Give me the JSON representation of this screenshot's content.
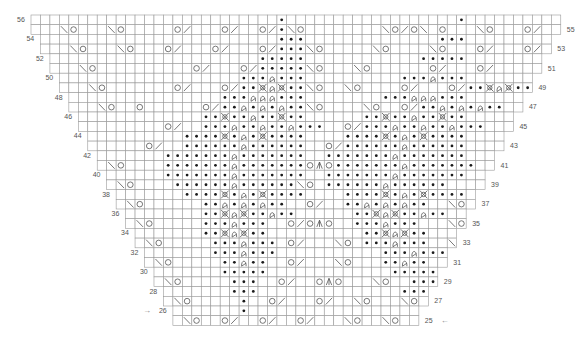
{
  "chart": {
    "origin_x": 31,
    "origin_y": 15,
    "cell_w": 9.46,
    "cell_h": 9.7,
    "cols": 56,
    "grid_color": "#9a9a9a",
    "symbol_color": "#555555",
    "purl_color": "#1a1a1a",
    "legend": {
      ".": "knit (empty)",
      "p": "purl (dot)",
      "o": "yarn over",
      "/": "k2tog",
      "\\": "ssk",
      "t": "twisted stitch",
      "x": "cross stitch",
      "a": "centered double decrease"
    },
    "rows": [
      {
        "n": 56,
        "s": 0,
        "e": 56,
        "d": "..........................p..................p.........."
      },
      {
        "n": 55,
        "s": 0,
        "e": 56,
        "d": "...\\o...\\o.....o/...o/..o/p\\o........\\o/o\\ o...\\o...o/...o/..."
      },
      {
        "n": 54,
        "s": 1,
        "e": 55,
        "d": "..........................ppp..............ppp........."
      },
      {
        "n": 53,
        "s": 1,
        "e": 55,
        "d": "....\\o...\\o...o/...o/...o/ppp\\o.....\\o....\\o...o/...o/..."
      },
      {
        "n": 52,
        "s": 2,
        "e": 54,
        "d": "........................ppppp............ppppp........"
      },
      {
        "n": 51,
        "s": 2,
        "e": 54,
        "d": ".....\\o..........o/...o/ppppp\\o...\\o......o/...o/......"
      },
      {
        "n": 50,
        "s": 3,
        "e": 53,
        "d": "......................ppptppp..........ppptppp........"
      },
      {
        "n": 49,
        "s": 3,
        "e": 53,
        "d": "......\\o.......o/...o/ppxtxpp\\o..\\o....o/...o/ppxtxpp."
      },
      {
        "n": 48,
        "s": 4,
        "e": 52,
        "d": "....................ppptttppp........ppptttppp........"
      },
      {
        "n": 47,
        "s": 4,
        "e": 52,
        "d": ".......\\o..o......o/pptptptpp\\o....\\o..o/pptptptpp....."
      },
      {
        "n": 46,
        "s": 5,
        "e": 51,
        "d": "..................ppxpptppxpp......ppxpptppxpp........."
      },
      {
        "n": 45,
        "s": 5,
        "e": 51,
        "d": "..............o/..ppptpptpptppp..o/ppptpptpptppp......."
      },
      {
        "n": 44,
        "s": 6,
        "e": 50,
        "d": "................ppppxptpxpppp....ppppxptpxpppp........."
      },
      {
        "n": 43,
        "s": 6,
        "e": 50,
        "d": "............o/..pppppptpppppp..o/pppppptpppppp........."
      },
      {
        "n": 42,
        "s": 7,
        "e": 49,
        "d": "..............ppppppptppppppp..ppppppptppppppp.........."
      },
      {
        "n": 41,
        "s": 7,
        "e": 49,
        "d": "........\\o....ppppppptpppppppoaoppppppptppppppp........."
      },
      {
        "n": 40,
        "s": 8,
        "e": 48,
        "d": "..............ppppppptppppppp..ppppppptppppppp........."
      },
      {
        "n": 39,
        "s": 8,
        "e": 48,
        "d": ".........\\o....pppppptpppppp\\o.pppppptpppppp..........."
      },
      {
        "n": 38,
        "s": 9,
        "e": 47,
        "d": "................ppppxptpxpppp....ppppxptpxpppp........."
      },
      {
        "n": 37,
        "s": 9,
        "e": 47,
        "d": "..........\\o......pptptptpp..o/..pptptptpp..\\o........"
      },
      {
        "n": 36,
        "s": 10,
        "e": 46,
        "d": "..................ppxtxpptpp......ppxtxpptpp..........."
      },
      {
        "n": 35,
        "s": 10,
        "e": 46,
        "d": "...........\\o.....ppptppp..o/oao..ppptppp...\\o........"
      },
      {
        "n": 34,
        "s": 11,
        "e": 45,
        "d": "..................ppxtxpp..........ppxtxpp............."
      },
      {
        "n": 33,
        "s": 11,
        "e": 45,
        "d": "............\\o.....ppptppp.o/...\\o.ppptppp..\\o........"
      },
      {
        "n": 32,
        "s": 12,
        "e": 44,
        "d": "...................ppptppp...........ppptppp..........."
      },
      {
        "n": 31,
        "s": 12,
        "e": 44,
        "d": ".............\\o.....pptpp..o/...\\o...pptpp....o/......."
      },
      {
        "n": 30,
        "s": 13,
        "e": 43,
        "d": "....................ppppp.............ppppp............"
      },
      {
        "n": 29,
        "s": 13,
        "e": 43,
        "d": "..............\\o.....ppp..o/..oao...\\o..ppp..o/........"
      },
      {
        "n": 28,
        "s": 14,
        "e": 42,
        "d": ".....................ppp...............ppp............."
      },
      {
        "n": 27,
        "s": 14,
        "e": 42,
        "d": "...............\\o.....p..o/...o/..\\o...\\o.p..o/........."
      },
      {
        "n": 26,
        "s": 15,
        "e": 41,
        "d": "......................p..................p............."
      },
      {
        "n": 25,
        "s": 15,
        "e": 41,
        "d": "................\\o..o/..o/..o/...\\o..\\o..\\o..o/........."
      }
    ],
    "left_labels": [
      "56",
      "54",
      "52",
      "50",
      "48",
      "46",
      "44",
      "42",
      "40",
      "38",
      "36",
      "34",
      "32",
      "30",
      "28",
      "26"
    ],
    "right_labels": [
      "55",
      "53",
      "51",
      "49",
      "47",
      "45",
      "43",
      "41",
      "39",
      "37",
      "35",
      "33",
      "31",
      "29",
      "27",
      "25"
    ],
    "start_arrow_left": "→",
    "start_arrow_right": "←"
  }
}
